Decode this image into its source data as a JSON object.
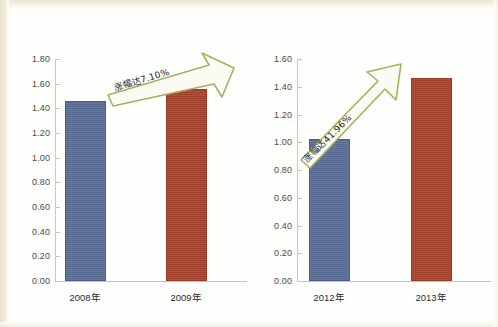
{
  "chart_data": [
    {
      "type": "bar",
      "title": "",
      "subtitle": "",
      "xlabel": "",
      "ylabel": "",
      "categories": [
        "2008年",
        "2009年"
      ],
      "values": [
        1.46,
        1.56
      ],
      "ylim": [
        0.0,
        1.8
      ],
      "ytick_labels": [
        "1.80",
        "1.60",
        "1.40",
        "1.20",
        "1.00",
        "0.80",
        "0.60",
        "0.40",
        "0.20",
        "0.00"
      ],
      "ytick_values": [
        1.8,
        1.6,
        1.4,
        1.2,
        1.0,
        0.8,
        0.6,
        0.4,
        0.2,
        0.0
      ],
      "grid": false,
      "legend": "none",
      "bar_colors": [
        "#5d6e99",
        "#ab432d"
      ],
      "annotations": [
        {
          "id": "growth-arrow-left",
          "text": "涨幅达7.10%",
          "shape": "block-arrow",
          "direction": "up-right",
          "color": "#a8b05a",
          "fill": "#fbfbf4"
        }
      ]
    },
    {
      "type": "bar",
      "title": "",
      "subtitle": "",
      "xlabel": "",
      "ylabel": "",
      "categories": [
        "2012年",
        "2013年"
      ],
      "values": [
        1.02,
        1.46
      ],
      "ylim": [
        0.0,
        1.6
      ],
      "ytick_labels": [
        "1.60",
        "1.40",
        "1.20",
        "1.00",
        "0.80",
        "0.60",
        "0.40",
        "0.20",
        "0.00"
      ],
      "ytick_values": [
        1.6,
        1.4,
        1.2,
        1.0,
        0.8,
        0.6,
        0.4,
        0.2,
        0.0
      ],
      "grid": false,
      "legend": "none",
      "bar_colors": [
        "#5d6e99",
        "#ab432d"
      ],
      "annotations": [
        {
          "id": "growth-arrow-right",
          "text": "涨幅达41.96%",
          "shape": "block-arrow",
          "direction": "up-right",
          "color": "#a8b05a",
          "fill": "#fbfbf4"
        }
      ]
    }
  ],
  "colors": {
    "series_blue": "#5d6e99",
    "series_red": "#ab432d",
    "arrow_outline": "#a8b05a",
    "arrow_fill": "#fbfbf4",
    "axis": "#c4c4c4",
    "tick_text": "#4a4a4a",
    "category_text": "#2c2c2c",
    "page_background": "#fefefd",
    "scan_edge": "#e9e5cf"
  }
}
